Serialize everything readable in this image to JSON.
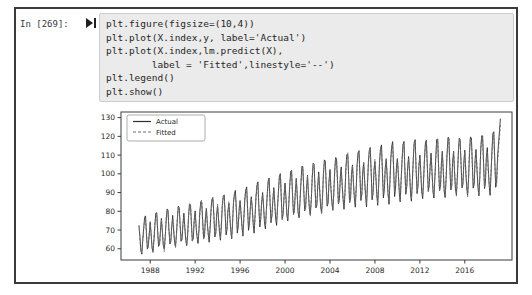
{
  "notebook": {
    "prompt": "In [269]:",
    "code_lines": [
      "plt.figure(figsize=(10,4))",
      "plt.plot(X.index,y, label='Actual')",
      "plt.plot(X.index,lm.predict(X),",
      "        label = 'Fitted',linestyle='--')",
      "plt.legend()",
      "plt.show()"
    ]
  },
  "colors": {
    "frame_border": "#3a3a3a",
    "cell_background": "#ebebeb",
    "cell_border": "#cdcdcd",
    "code_text": "#1f1f1f",
    "axis": "#3c3c3c",
    "tick_label": "#2a2a2a",
    "actual_line": "#2f2f2f",
    "fitted_line": "#6e6e6e"
  },
  "chart_data": {
    "type": "line",
    "title": "",
    "xlabel": "",
    "ylabel": "",
    "xlim": [
      1985.4,
      2020.2
    ],
    "ylim": [
      54,
      133
    ],
    "xticks": [
      1988,
      1992,
      1996,
      2000,
      2004,
      2008,
      2012,
      2016
    ],
    "yticks": [
      60,
      70,
      80,
      90,
      100,
      110,
      120,
      130
    ],
    "grid": false,
    "legend": {
      "position": "upper-left",
      "entries": [
        {
          "label": "Actual",
          "style": "solid",
          "color": "#2f2f2f"
        },
        {
          "label": "Fitted",
          "style": "dashed",
          "color": "#6e6e6e"
        }
      ]
    },
    "series_model": {
      "description": "Monthly seasonal time series 1987-2019; Actual and regression Fitted overlap closely",
      "x_start_year": 1987,
      "months_per_year": 12,
      "seasonal_pattern": [
        0.5,
        -0.1,
        -0.7,
        -1.0,
        -0.35,
        0.45,
        0.95,
        1.0,
        0.1,
        -0.75,
        -0.55,
        0.2
      ],
      "annual_base": [
        67,
        68.5,
        70,
        71.5,
        72.5,
        74,
        75.5,
        77,
        78.5,
        80,
        82,
        84,
        86,
        88,
        90,
        91.5,
        93,
        94.5,
        96,
        97.5,
        98.5,
        99.5,
        100.5,
        101,
        101.5,
        102,
        102.5,
        103,
        103.5,
        104,
        104.5
      ],
      "annual_amplitude": [
        10,
        10.5,
        11,
        11,
        11.5,
        11.5,
        12,
        12,
        12.5,
        12.5,
        13,
        13,
        13.5,
        13.5,
        14,
        14,
        14.5,
        14.5,
        15,
        15,
        15.5,
        15.5,
        16,
        15.5,
        16,
        15.5,
        16,
        16.5,
        15.5,
        16,
        16.5
      ],
      "fitted_scale": 0.95,
      "tail": {
        "x_start": 2018.0,
        "actual": [
          114,
          103.8,
          93.6,
          88.5,
          99.5,
          113.2,
          121.7,
          122.5,
          107.2,
          92.8,
          96.2,
          108.9,
          116,
          123,
          129.5
        ],
        "fitted": [
          111.5,
          101.5,
          95,
          90.5,
          101,
          110.5,
          119,
          120.5,
          104.5,
          94.5,
          93.5,
          106,
          113,
          119.5,
          126
        ]
      }
    }
  }
}
